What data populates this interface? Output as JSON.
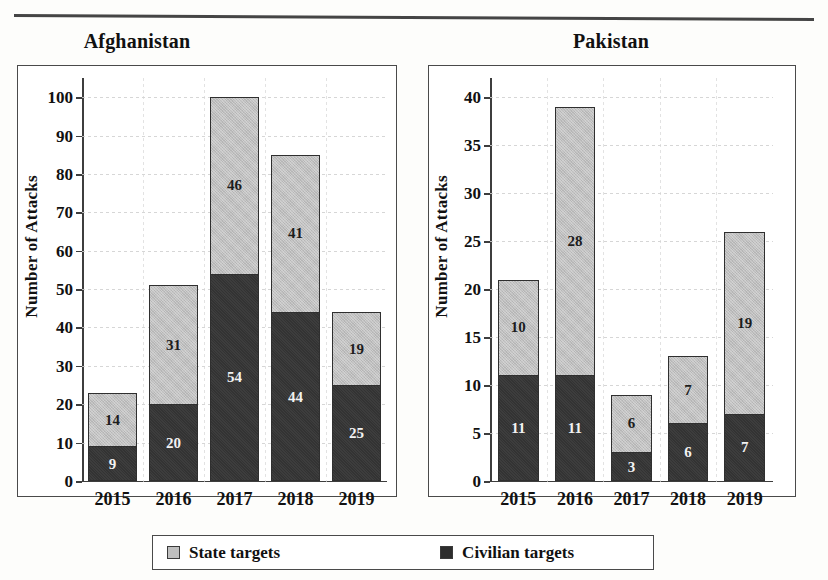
{
  "page": {
    "top_rule": "horizontal-rule"
  },
  "legend": {
    "items": [
      {
        "label": "State targets",
        "color": "#bfbfbf",
        "icon": "square-light-swatch"
      },
      {
        "label": "Civilian targets",
        "color": "#2d2d2d",
        "icon": "square-dark-swatch"
      }
    ]
  },
  "chart_data": [
    {
      "type": "bar",
      "stacked": true,
      "title": "Afghanistan",
      "xlabel": "",
      "ylabel": "Number of Attacks",
      "categories": [
        "2015",
        "2016",
        "2017",
        "2018",
        "2019"
      ],
      "ylim": [
        0,
        105
      ],
      "yticks": [
        0,
        10,
        20,
        30,
        40,
        50,
        60,
        70,
        80,
        90,
        100
      ],
      "grid": true,
      "legend_position": "bottom",
      "series": [
        {
          "name": "Civilian targets",
          "color": "#333333",
          "values": [
            9,
            20,
            54,
            44,
            25
          ]
        },
        {
          "name": "State targets",
          "color": "#bfbfbf",
          "values": [
            14,
            31,
            46,
            41,
            19
          ]
        }
      ],
      "totals": [
        23,
        51,
        100,
        85,
        44
      ]
    },
    {
      "type": "bar",
      "stacked": true,
      "title": "Pakistan",
      "xlabel": "",
      "ylabel": "Number of Attacks",
      "categories": [
        "2015",
        "2016",
        "2017",
        "2018",
        "2019"
      ],
      "ylim": [
        0,
        42
      ],
      "yticks": [
        0,
        5,
        10,
        15,
        20,
        25,
        30,
        35,
        40
      ],
      "grid": true,
      "legend_position": "bottom",
      "series": [
        {
          "name": "Civilian targets",
          "color": "#333333",
          "values": [
            11,
            11,
            3,
            6,
            7
          ]
        },
        {
          "name": "State targets",
          "color": "#bfbfbf",
          "values": [
            10,
            28,
            6,
            7,
            19
          ]
        }
      ],
      "totals": [
        21,
        39,
        9,
        13,
        26
      ]
    }
  ]
}
